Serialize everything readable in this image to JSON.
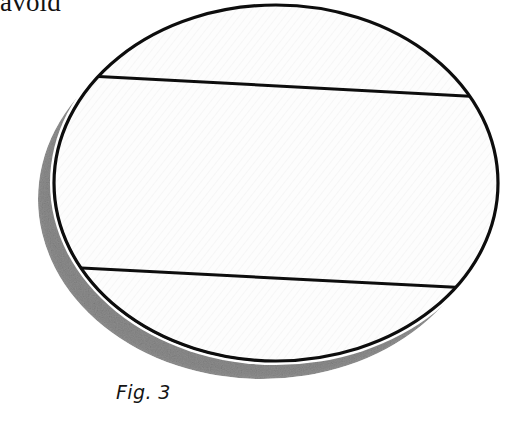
{
  "page": {
    "width": 522,
    "height": 421,
    "background_color": "#ffffff",
    "kind": "scanned-book-illustration"
  },
  "running_text": {
    "word": "avoid",
    "note": "clipped bottom of line of body text above the figure"
  },
  "figure": {
    "caption": "Fig. 3",
    "shape_name": "ellipse",
    "ink_color": "#0d0d0d",
    "fill_color": "#fdfdfd",
    "shadow_color": "#8e8e8e",
    "hatch_color": "#e6e6e6",
    "outline": {
      "center_x": 276,
      "center_y": 183,
      "radius_x": 224,
      "radius_y": 180,
      "stroke_width": 3.2
    },
    "shadow": {
      "center_x": 262,
      "center_y": 199,
      "radius_x": 224,
      "radius_y": 180,
      "offset_x": -14,
      "offset_y": 16
    },
    "chords": [
      {
        "name": "upper-chord",
        "x1": 82,
        "y1": 76,
        "x2": 492,
        "y2": 97,
        "stroke_width": 3.0
      },
      {
        "name": "lower-chord",
        "x1": 76,
        "y1": 268,
        "x2": 500,
        "y2": 289,
        "stroke_width": 3.0
      }
    ]
  }
}
